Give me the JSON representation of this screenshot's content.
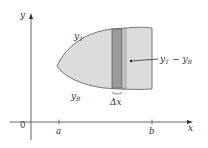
{
  "axes": {
    "x_label": "x",
    "y_label": "y",
    "origin_label": "0"
  },
  "ticks": {
    "a": "a",
    "b": "b"
  },
  "curves": {
    "top": "y",
    "top_sub": "T",
    "bottom": "y",
    "bottom_sub": "B"
  },
  "strip": {
    "width_label": "Δx",
    "height_label_y1": "y",
    "height_label_sub1": "T",
    "height_label_minus": " − ",
    "height_label_y2": "y",
    "height_label_sub2": "B"
  },
  "colors": {
    "region_fill": "#dcdcdc",
    "strip_fill": "#9a9a9a",
    "strip_light": "#c4c4c4",
    "outline": "#666666",
    "axis": "#555555"
  }
}
